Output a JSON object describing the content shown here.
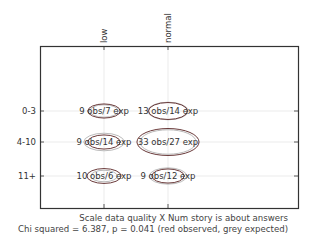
{
  "chart_data": {
    "type": "table",
    "subtype": "contingency-ellipse",
    "title": "Scale data quality X Num story is about answers",
    "subtitle": "Chi squared = 6.387, p = 0.041 (red observed, grey expected)",
    "x_categories": [
      "low",
      "normal"
    ],
    "y_categories": [
      "0-3",
      "4-10",
      "11+"
    ],
    "cells": [
      {
        "row": "0-3",
        "col": "low",
        "observed": 9,
        "expected": 7,
        "label": "9 obs/7 exp"
      },
      {
        "row": "0-3",
        "col": "normal",
        "observed": 13,
        "expected": 14,
        "label": "13 obs/14 exp"
      },
      {
        "row": "4-10",
        "col": "low",
        "observed": 9,
        "expected": 14,
        "label": "9 obs/14 exp"
      },
      {
        "row": "4-10",
        "col": "normal",
        "observed": 33,
        "expected": 27,
        "label": "33 obs/27 exp"
      },
      {
        "row": "11+",
        "col": "low",
        "observed": 10,
        "expected": 6,
        "label": "10 obs/6 exp"
      },
      {
        "row": "11+",
        "col": "normal",
        "observed": 9,
        "expected": 12,
        "label": "9 obs/12 exp"
      }
    ],
    "chi_squared": 6.387,
    "p_value": 0.041,
    "legend": {
      "observed": "red",
      "expected": "grey"
    },
    "grid": true
  },
  "colors": {
    "observed": "#6a3a3a",
    "expected": "#bbbbbb",
    "axis": "#333333",
    "grid": "#e6e6e6"
  },
  "captions": {
    "line1": "Scale data quality X Num story is about answers",
    "line2": "Chi squared = 6.387, p = 0.041 (red observed, grey expected)"
  }
}
